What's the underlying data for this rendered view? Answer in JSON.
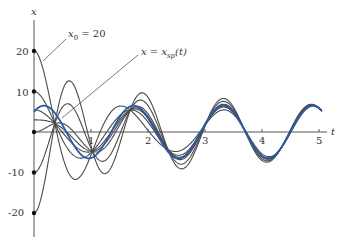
{
  "chart_data": {
    "type": "line",
    "title": "",
    "xlabel": "t",
    "ylabel": "x",
    "xlim": [
      0,
      5.1
    ],
    "ylim": [
      -25,
      28
    ],
    "x_ticks": [
      "1",
      "2",
      "3",
      "4",
      "5"
    ],
    "y_ticks": [
      "20",
      "10",
      "-10",
      "-20"
    ],
    "grid": false,
    "legend": null,
    "annotations": [
      {
        "text": "x0 = 20",
        "text_main": "x",
        "text_sub": "0",
        "text_rest": " = 20",
        "points_to_t": 0.15,
        "points_to_x": 17.6
      },
      {
        "text": "x = xsp(t)",
        "text_main": "x = x",
        "text_sub": "sp",
        "text_rest": "(t)",
        "points_to_t": 0.5,
        "points_to_x": 3.5
      }
    ],
    "model": {
      "steady_state": {
        "name": "x = xsp(t)",
        "amplitude": 6.5,
        "omega": 4.0,
        "phase": 0.7,
        "color": "#2a5aa8"
      },
      "transient": {
        "decay": 0.8,
        "omega": 4.75
      },
      "initial_values": [
        20,
        10,
        0,
        -10,
        -20
      ],
      "extra_initial_values": [
        5.5,
        3.0
      ],
      "t_range": [
        0,
        5.05
      ],
      "curve_color": "#4a4a4a"
    },
    "series": [
      {
        "name": "x0 = 20",
        "x0": 20
      },
      {
        "name": "x0 = 10",
        "x0": 10
      },
      {
        "name": "x0 = 0",
        "x0": 0
      },
      {
        "name": "x0 = -10",
        "x0": -10
      },
      {
        "name": "x0 = -20",
        "x0": -20
      },
      {
        "name": "x = xsp(t)",
        "x0": 4.9,
        "steady_state": true
      }
    ]
  }
}
